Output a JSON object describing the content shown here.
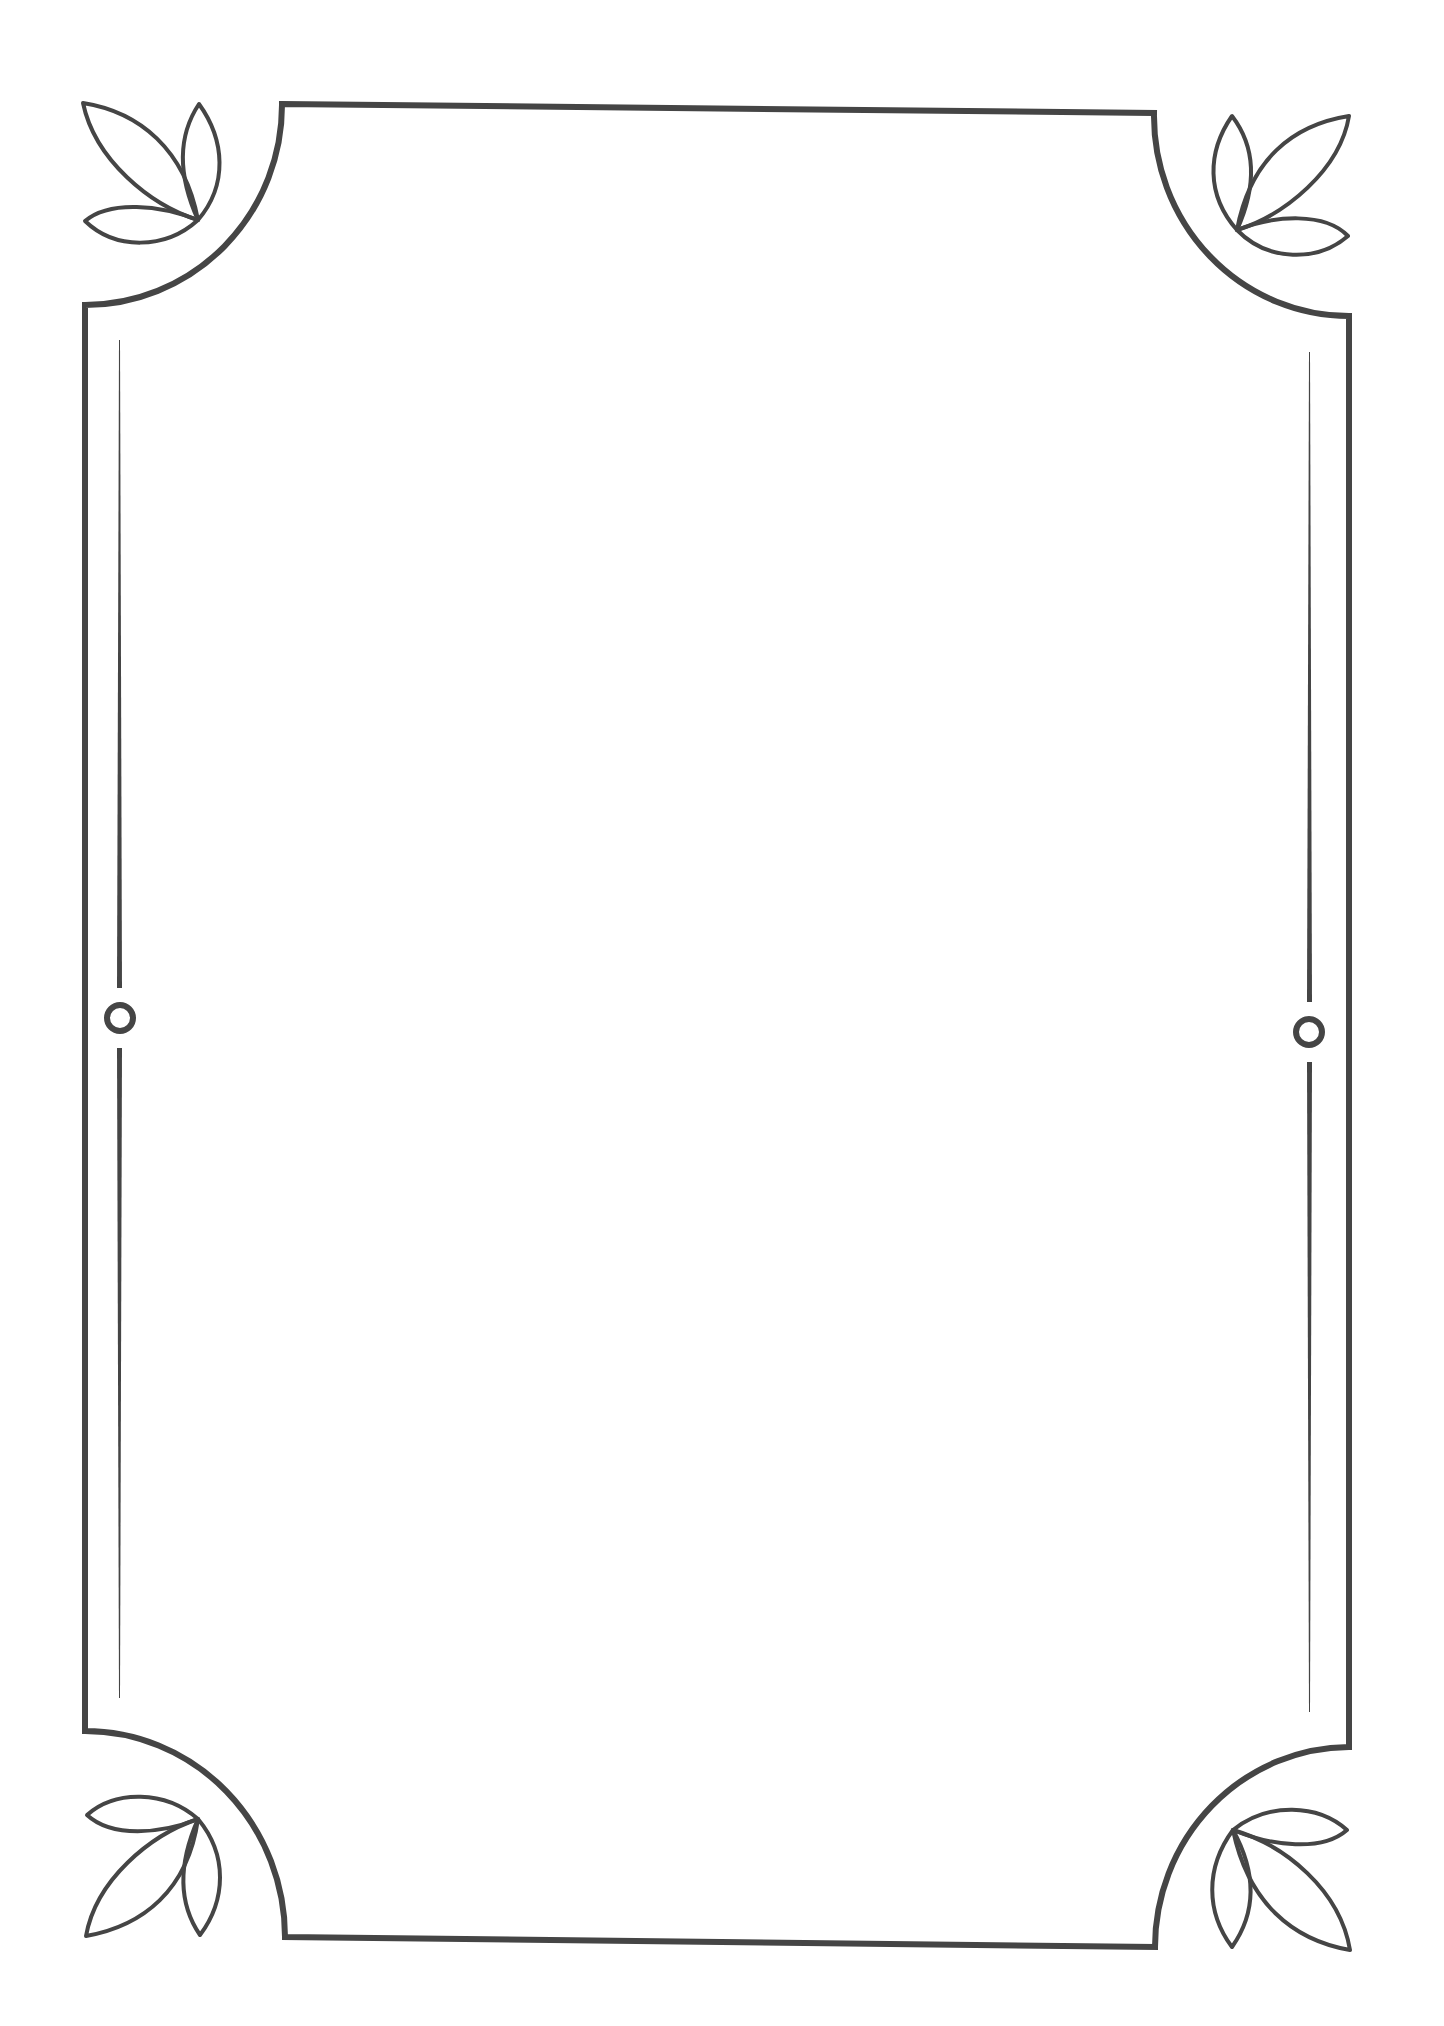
{
  "document": {
    "type": "decorative-page-border",
    "body_text": "",
    "colors": {
      "background": "#ffffff",
      "line": "#454545"
    }
  },
  "frame": {
    "corner_style": "concave-arc",
    "corner_ornament": "three-leaf-sprig",
    "side_ornament": "ring-with-tapered-lines"
  }
}
